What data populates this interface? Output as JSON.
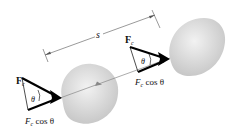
{
  "diagram": {
    "type": "physics-work-diagram",
    "displacement_label": "s",
    "left_position": {
      "force_label": "F",
      "force_subscript": "c",
      "angle_label": "θ",
      "component_label": "F",
      "component_subscript": "c",
      "component_text": " cos θ"
    },
    "right_position": {
      "force_label": "F",
      "force_subscript": "c",
      "angle_label": "θ",
      "component_label": "F",
      "component_subscript": "c",
      "component_text": " cos θ"
    },
    "colors": {
      "body": "#d4d4d4",
      "vector": "#000000",
      "path": "#777777",
      "dimension": "#555555"
    }
  }
}
